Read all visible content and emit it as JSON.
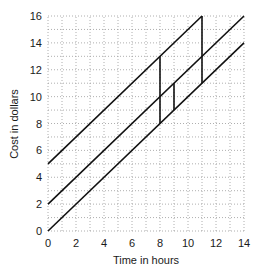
{
  "chart_data": {
    "type": "line",
    "title": "",
    "xlabel": "Time in hours",
    "ylabel": "Cost in dollars",
    "xlim": [
      0,
      14
    ],
    "ylim": [
      0,
      16
    ],
    "x_ticks": [
      0,
      2,
      4,
      6,
      8,
      10,
      12,
      14
    ],
    "y_ticks": [
      0,
      2,
      4,
      6,
      8,
      10,
      12,
      14,
      16
    ],
    "grid": true,
    "grid_minor_step": 1,
    "legend": null,
    "series": [
      {
        "name": "line-a",
        "equation": "y = x + 5",
        "x": [
          0,
          11
        ],
        "y": [
          5,
          16
        ]
      },
      {
        "name": "line-b",
        "equation": "y = x + 2",
        "x": [
          0,
          14
        ],
        "y": [
          2,
          16
        ]
      },
      {
        "name": "line-c",
        "equation": "y = x",
        "x": [
          0,
          14
        ],
        "y": [
          0,
          14
        ]
      }
    ],
    "vertical_segments": [
      {
        "x": 8,
        "y_from": 8,
        "y_to": 13
      },
      {
        "x": 9,
        "y_from": 9,
        "y_to": 11
      },
      {
        "x": 11,
        "y_from": 11,
        "y_to": 16
      }
    ],
    "colors": {
      "line": "#111111",
      "grid": "#9a9a9a",
      "text": "#1a1a1a"
    }
  }
}
